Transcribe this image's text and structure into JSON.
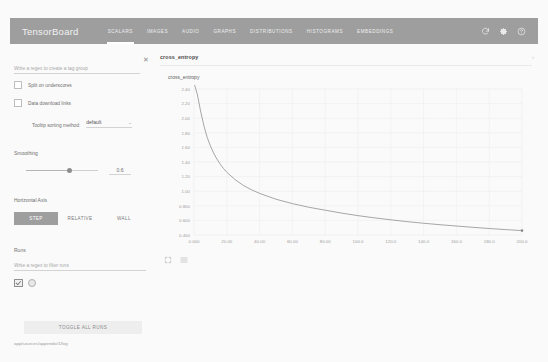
{
  "app": {
    "brand": "TensorBoard",
    "tabs": [
      {
        "label": "SCALARS",
        "active": true
      },
      {
        "label": "IMAGES",
        "active": false
      },
      {
        "label": "AUDIO",
        "active": false
      },
      {
        "label": "GRAPHS",
        "active": false
      },
      {
        "label": "DISTRIBUTIONS",
        "active": false
      },
      {
        "label": "HISTOGRAMS",
        "active": false
      },
      {
        "label": "EMBEDDINGS",
        "active": false
      }
    ],
    "icons": {
      "refresh": "refresh-icon",
      "settings": "gear-icon",
      "help": "help-icon"
    },
    "colors": {
      "header_bg": "#9e9e9e",
      "page_bg": "#fafafa",
      "accent": "#9e9e9e",
      "line": "#8a8a8a"
    }
  },
  "sidebar": {
    "tag_filter_placeholder": "Write a regex to create a tag group",
    "tag_filter_value": "",
    "clear_label": "✕",
    "checkboxes": [
      {
        "label": "Split on underscores",
        "checked": false
      },
      {
        "label": "Data download links",
        "checked": false
      }
    ],
    "tooltip_sorting": {
      "label": "Tooltip sorting method:",
      "value": "default",
      "caret": "⌄"
    },
    "smoothing": {
      "label": "Smoothing",
      "value": "0.6",
      "fraction": 0.6
    },
    "horizontal_axis": {
      "label": "Horizontal Axis",
      "options": [
        {
          "label": "STEP",
          "active": true
        },
        {
          "label": "RELATIVE",
          "active": false
        },
        {
          "label": "WALL",
          "active": false
        }
      ]
    },
    "runs": {
      "label": "Runs",
      "filter_placeholder": "Write a regex to filter runs",
      "filter_value": "",
      "items": [
        {
          "checked": true
        }
      ]
    },
    "toggle_all_label": "TOGGLE ALL RUNS",
    "logdir": "app/sources/appendix/1/log"
  },
  "main": {
    "section_title": "cross_entropy",
    "expand_icon": "chevron-right-icon",
    "card": {
      "title": "cross_entropy",
      "fullscreen_icon": "expand-icon",
      "table_icon": "data-table-icon"
    }
  },
  "chart_data": {
    "type": "line",
    "title": "cross_entropy",
    "xlabel": "",
    "ylabel": "",
    "xlim": [
      0,
      200
    ],
    "ylim": [
      0.4,
      2.5
    ],
    "grid": true,
    "legend": "none",
    "x_ticks": [
      "0.000",
      "20.00",
      "40.00",
      "60.00",
      "80.00",
      "100.0",
      "120.0",
      "140.0",
      "160.0",
      "180.0",
      "200.0"
    ],
    "y_ticks": [
      "2.40",
      "2.20",
      "2.00",
      "1.80",
      "1.60",
      "1.40",
      "1.20",
      "1.00",
      "0.800",
      "0.600",
      "0.400"
    ],
    "series": [
      {
        "name": "cross_entropy",
        "color": "#8a8a8a",
        "end_marker": true,
        "x": [
          0,
          2,
          4,
          6,
          8,
          10,
          12,
          14,
          16,
          18,
          20,
          25,
          30,
          35,
          40,
          50,
          60,
          70,
          80,
          90,
          100,
          110,
          120,
          130,
          140,
          150,
          160,
          170,
          180,
          190,
          200
        ],
        "y": [
          2.52,
          2.33,
          2.1,
          1.9,
          1.74,
          1.62,
          1.52,
          1.44,
          1.37,
          1.31,
          1.26,
          1.16,
          1.08,
          1.02,
          0.97,
          0.89,
          0.83,
          0.78,
          0.74,
          0.7,
          0.665,
          0.635,
          0.608,
          0.583,
          0.561,
          0.541,
          0.523,
          0.505,
          0.489,
          0.474,
          0.46
        ]
      }
    ]
  }
}
